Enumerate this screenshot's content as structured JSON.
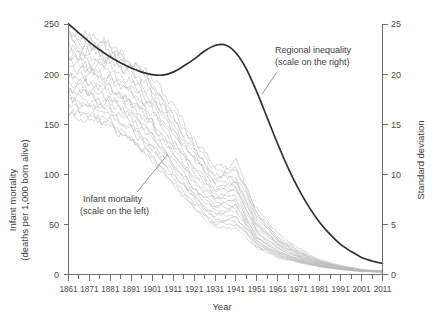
{
  "chart_data": {
    "type": "line",
    "title": "",
    "xlabel": "Year",
    "ylabel_left": "Infant mortality\n(deaths per 1,000 born alive)",
    "ylabel_left_line1": "Infant mortality",
    "ylabel_left_line2": "(deaths per 1,000 born alive)",
    "ylabel_right": "Standard deviation",
    "xlim": [
      1861,
      2011
    ],
    "ylim_left": [
      0,
      250
    ],
    "ylim_right": [
      0,
      25
    ],
    "grid": false,
    "legend": "annotations-inline",
    "x_ticks": [
      1861,
      1871,
      1881,
      1891,
      1901,
      1911,
      1921,
      1931,
      1941,
      1951,
      1961,
      1971,
      1981,
      1991,
      2001,
      2011
    ],
    "x_tick_labels": [
      "1861",
      "1871",
      "1881",
      "1891",
      "1901",
      "1911",
      "1921",
      "1931",
      "1941",
      "1951",
      "1961",
      "1971",
      "1981",
      "1991",
      "2001",
      "2011"
    ],
    "x_minor_tick_step": 5,
    "y_ticks_left": [
      0,
      50,
      100,
      150,
      200,
      250
    ],
    "y_tick_labels_left": [
      "0",
      "50",
      "100",
      "150",
      "200",
      "250"
    ],
    "y_ticks_right": [
      0,
      5,
      10,
      15,
      20,
      25
    ],
    "y_tick_labels_right": [
      "0",
      "5",
      "10",
      "15",
      "20",
      "25"
    ],
    "annotations": [
      {
        "name": "regional-inequality",
        "line1": "Regional inequality",
        "line2": "(scale on the right)",
        "x": 1947,
        "y_right": 21.5,
        "points_to": [
          1936,
          17.0
        ]
      },
      {
        "name": "infant-mortality",
        "line1": "Infant mortality",
        "line2": "(scale on the left)",
        "x": 1886,
        "y_left": 72,
        "points_to": [
          1905,
          122
        ]
      }
    ],
    "series": [
      {
        "name": "Regional inequality",
        "axis": "right",
        "color": "#2f2f2f",
        "style": "solid-thick",
        "x": [
          1861,
          1866,
          1871,
          1876,
          1881,
          1886,
          1891,
          1896,
          1901,
          1906,
          1911,
          1916,
          1921,
          1926,
          1931,
          1936,
          1941,
          1946,
          1951,
          1956,
          1961,
          1966,
          1971,
          1976,
          1981,
          1986,
          1991,
          1996,
          2001,
          2006,
          2011
        ],
        "values": [
          25.0,
          24.1,
          23.2,
          22.4,
          21.7,
          21.1,
          20.6,
          20.2,
          19.95,
          19.9,
          20.2,
          20.8,
          21.5,
          22.3,
          22.85,
          22.9,
          22.1,
          20.5,
          18.2,
          15.6,
          13.0,
          10.6,
          8.5,
          6.7,
          5.2,
          4.0,
          3.0,
          2.3,
          1.7,
          1.35,
          1.1
        ]
      },
      {
        "name": "Region 01",
        "axis": "left",
        "color": "#b9b9b9",
        "x": [
          1861,
          1871,
          1881,
          1891,
          1901,
          1911,
          1921,
          1931,
          1941,
          1951,
          1961,
          1971,
          1981,
          1991,
          2001,
          2011
        ],
        "values": [
          248,
          238,
          226,
          216,
          196,
          168,
          136,
          110,
          104,
          66,
          40,
          26,
          15,
          9,
          5,
          3.5
        ]
      },
      {
        "name": "Region 02",
        "axis": "left",
        "color": "#b9b9b9",
        "x": [
          1861,
          1871,
          1881,
          1891,
          1901,
          1911,
          1921,
          1931,
          1941,
          1951,
          1961,
          1971,
          1981,
          1991,
          2001,
          2011
        ],
        "values": [
          238,
          232,
          222,
          210,
          190,
          162,
          130,
          104,
          98,
          62,
          38,
          24,
          14,
          8.5,
          4.8,
          3.3
        ]
      },
      {
        "name": "Region 03",
        "axis": "left",
        "color": "#b9b9b9",
        "x": [
          1861,
          1871,
          1881,
          1891,
          1901,
          1911,
          1921,
          1931,
          1941,
          1951,
          1961,
          1971,
          1981,
          1991,
          2001,
          2011
        ],
        "values": [
          230,
          228,
          218,
          204,
          184,
          156,
          126,
          100,
          95,
          58,
          35,
          22,
          13,
          8,
          4.6,
          3.2
        ]
      },
      {
        "name": "Region 04",
        "axis": "left",
        "color": "#b9b9b9",
        "x": [
          1861,
          1871,
          1881,
          1891,
          1901,
          1911,
          1921,
          1931,
          1941,
          1951,
          1961,
          1971,
          1981,
          1991,
          2001,
          2011
        ],
        "values": [
          225,
          220,
          212,
          198,
          178,
          150,
          120,
          94,
          90,
          54,
          33,
          21,
          12.5,
          7.6,
          4.4,
          3.1
        ]
      },
      {
        "name": "Region 05",
        "axis": "left",
        "color": "#b9b9b9",
        "x": [
          1861,
          1871,
          1881,
          1891,
          1901,
          1911,
          1921,
          1931,
          1941,
          1951,
          1961,
          1971,
          1981,
          1991,
          2001,
          2011
        ],
        "values": [
          220,
          214,
          206,
          192,
          172,
          144,
          114,
          90,
          86,
          50,
          31,
          20,
          12,
          7.2,
          4.2,
          3.0
        ]
      },
      {
        "name": "Region 06",
        "axis": "left",
        "color": "#b9b9b9",
        "x": [
          1861,
          1871,
          1881,
          1891,
          1901,
          1911,
          1921,
          1931,
          1941,
          1951,
          1961,
          1971,
          1981,
          1991,
          2001,
          2011
        ],
        "values": [
          214,
          208,
          200,
          186,
          166,
          138,
          108,
          86,
          82,
          47,
          29,
          19,
          11.5,
          7.0,
          4.1,
          3.0
        ]
      },
      {
        "name": "Region 07",
        "axis": "left",
        "color": "#b9b9b9",
        "x": [
          1861,
          1871,
          1881,
          1891,
          1901,
          1911,
          1921,
          1931,
          1941,
          1951,
          1961,
          1971,
          1981,
          1991,
          2001,
          2011
        ],
        "values": [
          208,
          202,
          194,
          180,
          160,
          132,
          102,
          81,
          78,
          44,
          27,
          18,
          11,
          6.7,
          3.9,
          2.9
        ]
      },
      {
        "name": "Region 08",
        "axis": "left",
        "color": "#b9b9b9",
        "x": [
          1861,
          1871,
          1881,
          1891,
          1901,
          1911,
          1921,
          1931,
          1941,
          1951,
          1961,
          1971,
          1981,
          1991,
          2001,
          2011
        ],
        "values": [
          202,
          196,
          188,
          174,
          154,
          126,
          97,
          77,
          74,
          41,
          25,
          17,
          10.5,
          6.4,
          3.8,
          2.8
        ]
      },
      {
        "name": "Region 09",
        "axis": "left",
        "color": "#b9b9b9",
        "x": [
          1861,
          1871,
          1881,
          1891,
          1901,
          1911,
          1921,
          1931,
          1941,
          1951,
          1961,
          1971,
          1981,
          1991,
          2001,
          2011
        ],
        "values": [
          196,
          190,
          182,
          168,
          148,
          120,
          92,
          72,
          70,
          38,
          23,
          16,
          10,
          6.1,
          3.7,
          2.8
        ]
      },
      {
        "name": "Region 10",
        "axis": "left",
        "color": "#b9b9b9",
        "x": [
          1861,
          1871,
          1881,
          1891,
          1901,
          1911,
          1921,
          1931,
          1941,
          1951,
          1961,
          1971,
          1981,
          1991,
          2001,
          2011
        ],
        "values": [
          190,
          184,
          176,
          162,
          142,
          115,
          87,
          68,
          66,
          36,
          22,
          15,
          9.5,
          5.9,
          3.6,
          2.7
        ]
      },
      {
        "name": "Region 11",
        "axis": "left",
        "color": "#b9b9b9",
        "x": [
          1861,
          1871,
          1881,
          1891,
          1901,
          1911,
          1921,
          1931,
          1941,
          1951,
          1961,
          1971,
          1981,
          1991,
          2001,
          2011
        ],
        "values": [
          184,
          178,
          170,
          156,
          136,
          110,
          83,
          64,
          62,
          34,
          21,
          14,
          9.0,
          5.7,
          3.5,
          2.7
        ]
      },
      {
        "name": "Region 12",
        "axis": "left",
        "color": "#b9b9b9",
        "x": [
          1861,
          1871,
          1881,
          1891,
          1901,
          1911,
          1921,
          1931,
          1941,
          1951,
          1961,
          1971,
          1981,
          1991,
          2001,
          2011
        ],
        "values": [
          178,
          172,
          164,
          150,
          130,
          105,
          78,
          60,
          58,
          32,
          20,
          13.5,
          8.6,
          5.5,
          3.4,
          2.6
        ]
      },
      {
        "name": "Region 13",
        "axis": "left",
        "color": "#b9b9b9",
        "x": [
          1861,
          1871,
          1881,
          1891,
          1901,
          1911,
          1921,
          1931,
          1941,
          1951,
          1961,
          1971,
          1981,
          1991,
          2001,
          2011
        ],
        "values": [
          172,
          166,
          158,
          144,
          124,
          100,
          74,
          56,
          54,
          30,
          19,
          13,
          8.3,
          5.3,
          3.3,
          2.6
        ]
      },
      {
        "name": "Region 14",
        "axis": "left",
        "color": "#b9b9b9",
        "x": [
          1861,
          1871,
          1881,
          1891,
          1901,
          1911,
          1921,
          1931,
          1941,
          1951,
          1961,
          1971,
          1981,
          1991,
          2001,
          2011
        ],
        "values": [
          166,
          160,
          152,
          138,
          118,
          95,
          70,
          52,
          50,
          28,
          18,
          12.5,
          8.0,
          5.1,
          3.2,
          2.5
        ]
      },
      {
        "name": "Region 15",
        "axis": "left",
        "color": "#b9b9b9",
        "x": [
          1861,
          1871,
          1881,
          1891,
          1901,
          1911,
          1921,
          1931,
          1941,
          1951,
          1961,
          1971,
          1981,
          1991,
          2001,
          2011
        ],
        "values": [
          160,
          155,
          147,
          133,
          113,
          90,
          66,
          48,
          46,
          26,
          17,
          12,
          7.7,
          4.9,
          3.1,
          2.5
        ]
      },
      {
        "name": "Region 16",
        "axis": "left",
        "color": "#b9b9b9",
        "x": [
          1861,
          1871,
          1881,
          1891,
          1901,
          1911,
          1921,
          1931,
          1941,
          1951,
          1961,
          1971,
          1981,
          1991,
          2001,
          2011
        ],
        "values": [
          243,
          234,
          230,
          213,
          188,
          160,
          124,
          96,
          112,
          60,
          36,
          23,
          13.5,
          8.2,
          4.7,
          3.3
        ]
      },
      {
        "name": "Region 17",
        "axis": "left",
        "color": "#b9b9b9",
        "x": [
          1861,
          1871,
          1881,
          1891,
          1901,
          1911,
          1921,
          1931,
          1941,
          1951,
          1961,
          1971,
          1981,
          1991,
          2001,
          2011
        ],
        "values": [
          234,
          224,
          216,
          200,
          175,
          146,
          116,
          92,
          106,
          56,
          34,
          21.5,
          12.8,
          7.8,
          4.5,
          3.2
        ]
      },
      {
        "name": "Region 18",
        "axis": "left",
        "color": "#b9b9b9",
        "x": [
          1861,
          1871,
          1881,
          1891,
          1901,
          1911,
          1921,
          1931,
          1941,
          1951,
          1961,
          1971,
          1981,
          1991,
          2001,
          2011
        ],
        "values": [
          212,
          206,
          198,
          183,
          163,
          134,
          105,
          83,
          94,
          49,
          30,
          19.5,
          11.8,
          7.1,
          4.2,
          3.0
        ]
      },
      {
        "name": "Region 19",
        "axis": "left",
        "color": "#b9b9b9",
        "x": [
          1861,
          1871,
          1881,
          1891,
          1901,
          1911,
          1921,
          1931,
          1941,
          1951,
          1961,
          1971,
          1981,
          1991,
          2001,
          2011
        ],
        "values": [
          198,
          193,
          185,
          171,
          151,
          123,
          95,
          75,
          86,
          43,
          26,
          17.5,
          10.8,
          6.6,
          3.9,
          2.9
        ]
      },
      {
        "name": "Region 20",
        "axis": "left",
        "color": "#b9b9b9",
        "x": [
          1861,
          1871,
          1881,
          1891,
          1901,
          1911,
          1921,
          1931,
          1941,
          1951,
          1961,
          1971,
          1981,
          1991,
          2001,
          2011
        ],
        "values": [
          186,
          180,
          173,
          159,
          139,
          112,
          85,
          66,
          76,
          37,
          23,
          15.5,
          9.8,
          6.0,
          3.6,
          2.7
        ]
      },
      {
        "name": "Region 21",
        "axis": "left",
        "color": "#b9b9b9",
        "x": [
          1861,
          1871,
          1881,
          1891,
          1901,
          1911,
          1921,
          1931,
          1941,
          1951,
          1961,
          1971,
          1981,
          1991,
          2001,
          2011
        ],
        "values": [
          175,
          169,
          161,
          147,
          127,
          102,
          76,
          58,
          68,
          33,
          20.5,
          14,
          8.9,
          5.6,
          3.4,
          2.6
        ]
      },
      {
        "name": "Region 22",
        "axis": "left",
        "color": "#b9b9b9",
        "x": [
          1861,
          1871,
          1881,
          1891,
          1901,
          1911,
          1921,
          1931,
          1941,
          1951,
          1961,
          1971,
          1981,
          1991,
          2001,
          2011
        ],
        "values": [
          163,
          158,
          150,
          136,
          116,
          93,
          68,
          50,
          58,
          29,
          18.5,
          12.8,
          8.1,
          5.2,
          3.2,
          2.5
        ]
      }
    ]
  }
}
